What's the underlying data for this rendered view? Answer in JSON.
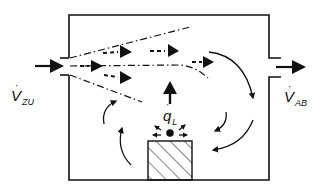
{
  "diagram": {
    "type": "room ventilation airflow schematic",
    "labels": {
      "inflow": {
        "symbol": "V",
        "subscript": "ZU",
        "dot": "·"
      },
      "outflow": {
        "symbol": "V",
        "subscript": "AB",
        "dot": "·"
      },
      "heat_load": {
        "symbol": "q",
        "subscript": "L",
        "dot": "·"
      }
    },
    "elements": {
      "room": "room-enclosure",
      "inlet": "supply-air-inlet",
      "outlet": "exhaust-air-outlet",
      "heat_source": "heat-source-block",
      "jet": "supply-air-jet (dash-dot spread lines with dashed flow arrows)",
      "recirculation": "curved circulation arrows",
      "plume": "thermal plume arrow upward"
    },
    "colors": {
      "stroke": "#111111",
      "background": "#ffffff"
    }
  }
}
